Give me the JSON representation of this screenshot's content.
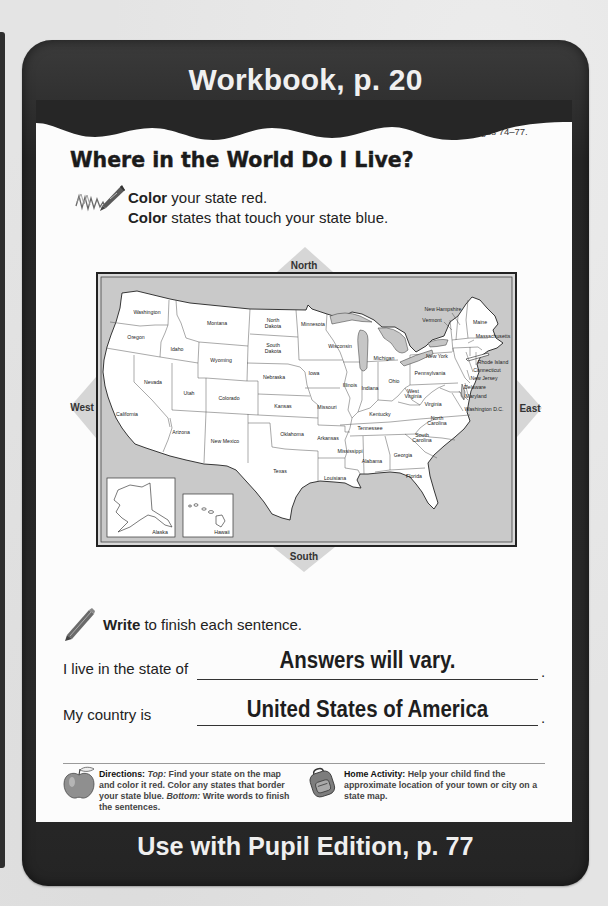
{
  "header": {
    "title": "Workbook, p. 20"
  },
  "worksheet": {
    "title": "Where in the World Do I Live?",
    "page_ref": "Use with Pages 74–77."
  },
  "instructions": [
    {
      "verb": "Color",
      "text": " your state red."
    },
    {
      "verb": "Color",
      "text": " states that touch your state blue."
    }
  ],
  "map": {
    "compass": {
      "north": "North",
      "south": "South",
      "east": "East",
      "west": "West"
    },
    "states": [
      {
        "name": "Washington",
        "lines": [
          "Washington"
        ]
      },
      {
        "name": "Oregon",
        "lines": [
          "Oregon"
        ]
      },
      {
        "name": "Idaho",
        "lines": [
          "Idaho"
        ]
      },
      {
        "name": "Montana",
        "lines": [
          "Montana"
        ]
      },
      {
        "name": "North Dakota",
        "lines": [
          "North",
          "Dakota"
        ]
      },
      {
        "name": "South Dakota",
        "lines": [
          "South",
          "Dakota"
        ]
      },
      {
        "name": "Wyoming",
        "lines": [
          "Wyoming"
        ]
      },
      {
        "name": "Nebraska",
        "lines": [
          "Nebraska"
        ]
      },
      {
        "name": "Nevada",
        "lines": [
          "Nevada"
        ]
      },
      {
        "name": "Utah",
        "lines": [
          "Utah"
        ]
      },
      {
        "name": "Colorado",
        "lines": [
          "Colorado"
        ]
      },
      {
        "name": "Kansas",
        "lines": [
          "Kansas"
        ]
      },
      {
        "name": "California",
        "lines": [
          "California"
        ]
      },
      {
        "name": "Arizona",
        "lines": [
          "Arizona"
        ]
      },
      {
        "name": "New Mexico",
        "lines": [
          "New Mexico"
        ]
      },
      {
        "name": "Oklahoma",
        "lines": [
          "Oklahoma"
        ]
      },
      {
        "name": "Texas",
        "lines": [
          "Texas"
        ]
      },
      {
        "name": "Minnesota",
        "lines": [
          "Minnesota"
        ]
      },
      {
        "name": "Wisconsin",
        "lines": [
          "Wisconsin"
        ]
      },
      {
        "name": "Michigan",
        "lines": [
          "Michigan"
        ]
      },
      {
        "name": "Iowa",
        "lines": [
          "Iowa"
        ]
      },
      {
        "name": "Illinois",
        "lines": [
          "Illinois"
        ]
      },
      {
        "name": "Indiana",
        "lines": [
          "Indiana"
        ]
      },
      {
        "name": "Ohio",
        "lines": [
          "Ohio"
        ]
      },
      {
        "name": "Missouri",
        "lines": [
          "Missouri"
        ]
      },
      {
        "name": "Kentucky",
        "lines": [
          "Kentucky"
        ]
      },
      {
        "name": "Tennessee",
        "lines": [
          "Tennessee"
        ]
      },
      {
        "name": "Arkansas",
        "lines": [
          "Arkansas"
        ]
      },
      {
        "name": "Mississippi",
        "lines": [
          "Mississippi"
        ]
      },
      {
        "name": "Alabama",
        "lines": [
          "Alabama"
        ]
      },
      {
        "name": "Georgia",
        "lines": [
          "Georgia"
        ]
      },
      {
        "name": "Louisiana",
        "lines": [
          "Louisiana"
        ]
      },
      {
        "name": "Florida",
        "lines": [
          "Florida"
        ]
      },
      {
        "name": "South Carolina",
        "lines": [
          "South",
          "Carolina"
        ]
      },
      {
        "name": "North Carolina",
        "lines": [
          "North",
          "Carolina"
        ]
      },
      {
        "name": "Virginia",
        "lines": [
          "Virginia"
        ]
      },
      {
        "name": "West Virginia",
        "lines": [
          "West",
          "Virginia"
        ]
      },
      {
        "name": "Pennsylvania",
        "lines": [
          "Pennsylvania"
        ]
      },
      {
        "name": "New York",
        "lines": [
          "New York"
        ]
      },
      {
        "name": "Vermont",
        "lines": [
          "Vermont"
        ]
      },
      {
        "name": "New Hampshire",
        "lines": [
          "New Hampshire"
        ]
      },
      {
        "name": "Maine",
        "lines": [
          "Maine"
        ]
      },
      {
        "name": "Massachusetts",
        "lines": [
          "Massachusetts"
        ]
      },
      {
        "name": "Rhode Island",
        "lines": [
          "Rhode Island"
        ]
      },
      {
        "name": "Connecticut",
        "lines": [
          "Connecticut"
        ]
      },
      {
        "name": "New Jersey",
        "lines": [
          "New Jersey"
        ]
      },
      {
        "name": "Delaware",
        "lines": [
          "Delaware"
        ]
      },
      {
        "name": "Maryland",
        "lines": [
          "Maryland"
        ]
      },
      {
        "name": "Washington D.C.",
        "lines": [
          "Washington D.C."
        ]
      },
      {
        "name": "Alaska",
        "lines": [
          "Alaska"
        ]
      },
      {
        "name": "Hawaii",
        "lines": [
          "Hawaii"
        ]
      }
    ]
  },
  "writing": {
    "instruction_verb": "Write",
    "instruction_text": " to finish each sentence.",
    "sentences": [
      {
        "prompt": "I live in the state of",
        "answer": "Answers will vary.",
        "end": "."
      },
      {
        "prompt": "My country is",
        "answer": "United States of America",
        "end": "."
      }
    ]
  },
  "notes": {
    "directions": {
      "label": "Directions:",
      "top_label": "Top:",
      "top_text": " Find your state on the map and color it red. Color any states that border your state blue. ",
      "bottom_label": "Bottom:",
      "bottom_text": " Write words to finish the sentences."
    },
    "home_activity": {
      "label": "Home Activity:",
      "text": " Help your child find the approximate location of your town or city on a state map."
    }
  },
  "footer": {
    "text": "Use with Pupil Edition, p. 77"
  },
  "colors": {
    "card": "#2a2a2a",
    "panel": "#fcfcfc",
    "map_water": "#c9c9c9",
    "land": "#ffffff",
    "compass_marker": "#d6d6d6",
    "header_text": "#f0f0f0"
  }
}
